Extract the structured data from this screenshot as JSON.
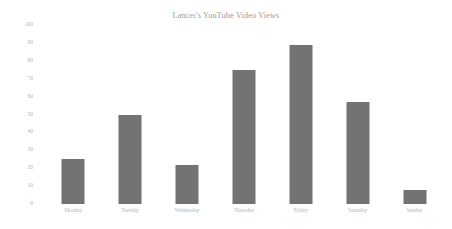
{
  "chart_data": {
    "type": "bar",
    "title": "Lancer's YouTube Video Views",
    "xlabel": "",
    "ylabel": "",
    "categories": [
      "Monday",
      "Tuesday",
      "Wednesday",
      "Thursday",
      "Friday",
      "Saturday",
      "Sunday"
    ],
    "values": [
      25,
      50,
      22,
      75,
      89,
      57,
      8
    ],
    "series": [
      {
        "name": "Video Views",
        "values": [
          25,
          50,
          22,
          75,
          89,
          57,
          8
        ]
      }
    ],
    "ylim": [
      0,
      100
    ],
    "yticks": [
      0,
      10,
      20,
      30,
      40,
      50,
      60,
      70,
      80,
      90,
      100
    ],
    "ytick_labels": [
      "0",
      "10",
      "20",
      "30",
      "40",
      "50",
      "60",
      "70",
      "80",
      "90",
      "100"
    ],
    "grid": false,
    "legend": false,
    "legend_position": "none",
    "bar_color": "#737373",
    "background_color": "#ffffff",
    "text_color": "#b4b4b4",
    "title_color": "#9a9a9a"
  }
}
